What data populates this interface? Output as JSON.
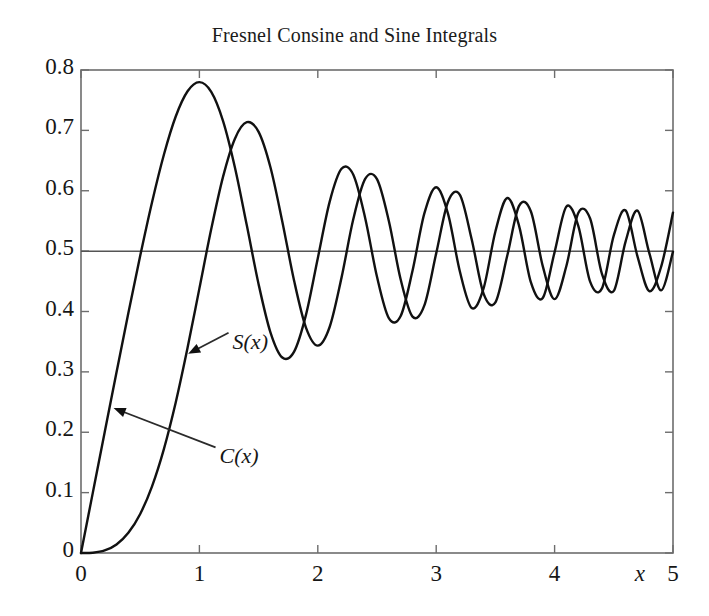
{
  "chart_data": {
    "type": "line",
    "title": "Fresnel Consine and Sine Integrals",
    "xlabel": "x",
    "ylabel": "",
    "xlim": [
      0,
      5
    ],
    "ylim": [
      0,
      0.8
    ],
    "grid": false,
    "legend_position": "inline-annotations",
    "xticks": [
      "0",
      "1",
      "2",
      "3",
      "4",
      "5"
    ],
    "xtick_values": [
      0,
      1,
      2,
      3,
      4,
      5
    ],
    "yticks": [
      "0",
      "0.1",
      "0.2",
      "0.3",
      "0.4",
      "0.5",
      "0.6",
      "0.7",
      "0.8"
    ],
    "ytick_values": [
      0,
      0.1,
      0.2,
      0.3,
      0.4,
      0.5,
      0.6,
      0.7,
      0.8
    ],
    "line_color": "#111111",
    "asymptote": {
      "label": "0.5",
      "value": 0.5,
      "color": "#555555"
    },
    "annotations": [
      {
        "text": "S(x)",
        "x": 1.28,
        "y": 0.345,
        "arrow_to_x": 0.905,
        "arrow_to_y": 0.33
      },
      {
        "text": "C(x)",
        "x": 1.17,
        "y": 0.155,
        "arrow_to_x": 0.275,
        "arrow_to_y": 0.24
      }
    ],
    "series": [
      {
        "name": "C(x)",
        "x": [
          0,
          0.1,
          0.2,
          0.3,
          0.4,
          0.5,
          0.6,
          0.7,
          0.8,
          0.9,
          1.0,
          1.1,
          1.2,
          1.3,
          1.4,
          1.5,
          1.6,
          1.7,
          1.8,
          1.9,
          2.0,
          2.1,
          2.2,
          2.3,
          2.4,
          2.5,
          2.6,
          2.7,
          2.8,
          2.9,
          3.0,
          3.1,
          3.2,
          3.3,
          3.4,
          3.5,
          3.6,
          3.7,
          3.8,
          3.9,
          4.0,
          4.1,
          4.2,
          4.3,
          4.4,
          4.5,
          4.6,
          4.7,
          4.8,
          4.9,
          5.0
        ],
        "y": [
          0.0,
          0.1,
          0.1999,
          0.2994,
          0.3975,
          0.4923,
          0.5811,
          0.6597,
          0.723,
          0.7648,
          0.7799,
          0.7638,
          0.7154,
          0.6386,
          0.5431,
          0.4453,
          0.3655,
          0.3238,
          0.3336,
          0.3944,
          0.4883,
          0.5816,
          0.6363,
          0.6266,
          0.555,
          0.4574,
          0.389,
          0.3925,
          0.4675,
          0.5624,
          0.6058,
          0.5616,
          0.4663,
          0.4058,
          0.4382,
          0.5326,
          0.588,
          0.5419,
          0.4481,
          0.4223,
          0.4984,
          0.5738,
          0.5418,
          0.4494,
          0.4383,
          0.5261,
          0.5673,
          0.4914,
          0.4338,
          0.4743,
          0.5638
        ]
      },
      {
        "name": "S(x)",
        "x": [
          0,
          0.1,
          0.2,
          0.3,
          0.4,
          0.5,
          0.6,
          0.7,
          0.8,
          0.9,
          1.0,
          1.1,
          1.2,
          1.3,
          1.4,
          1.5,
          1.6,
          1.7,
          1.8,
          1.9,
          2.0,
          2.1,
          2.2,
          2.3,
          2.4,
          2.5,
          2.6,
          2.7,
          2.8,
          2.9,
          3.0,
          3.1,
          3.2,
          3.3,
          3.4,
          3.5,
          3.6,
          3.7,
          3.8,
          3.9,
          4.0,
          4.1,
          4.2,
          4.3,
          4.4,
          4.5,
          4.6,
          4.7,
          4.8,
          4.9,
          5.0
        ],
        "y": [
          0.0,
          0.0005,
          0.0042,
          0.0141,
          0.0334,
          0.0647,
          0.1105,
          0.1721,
          0.2493,
          0.3398,
          0.4383,
          0.5365,
          0.6234,
          0.6863,
          0.7135,
          0.6975,
          0.6389,
          0.5492,
          0.4509,
          0.3733,
          0.3434,
          0.3743,
          0.4557,
          0.5531,
          0.6197,
          0.6192,
          0.55,
          0.4529,
          0.3915,
          0.4101,
          0.4963,
          0.5818,
          0.5933,
          0.5193,
          0.4296,
          0.4152,
          0.4923,
          0.575,
          0.5656,
          0.4752,
          0.4205,
          0.4758,
          0.5632,
          0.554,
          0.4623,
          0.4342,
          0.5162,
          0.567,
          0.4968,
          0.435,
          0.4992
        ]
      }
    ]
  },
  "axes": {
    "x_axis_label": "x"
  }
}
